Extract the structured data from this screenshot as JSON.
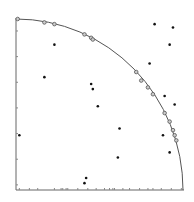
{
  "chart_data": {
    "type": "scatter",
    "title": "",
    "xlabel": "",
    "ylabel": "",
    "xlim": [
      0,
      1
    ],
    "ylim": [
      0,
      1
    ],
    "grid": false,
    "legend": null,
    "annotations": [],
    "reference_curve": {
      "type": "quarter-circle",
      "radius": 1,
      "center": [
        0,
        0
      ]
    },
    "series": [
      {
        "name": "on-arc points",
        "marker": "open-circle",
        "points": [
          [
            0.01,
            1.0
          ],
          [
            0.17,
            0.98
          ],
          [
            0.23,
            0.97
          ],
          [
            0.41,
            0.91
          ],
          [
            0.45,
            0.89
          ],
          [
            0.46,
            0.88
          ],
          [
            0.72,
            0.69
          ],
          [
            0.75,
            0.64
          ],
          [
            0.79,
            0.6
          ],
          [
            0.82,
            0.56
          ],
          [
            0.89,
            0.45
          ],
          [
            0.92,
            0.4
          ],
          [
            0.94,
            0.35
          ],
          [
            0.95,
            0.32
          ],
          [
            0.96,
            0.29
          ]
        ]
      },
      {
        "name": "interior points",
        "marker": "filled-dot",
        "points": [
          [
            0.23,
            0.85
          ],
          [
            0.17,
            0.66
          ],
          [
            0.45,
            0.62
          ],
          [
            0.46,
            0.59
          ],
          [
            0.49,
            0.49
          ],
          [
            0.62,
            0.36
          ],
          [
            0.61,
            0.19
          ],
          [
            0.83,
            0.97
          ],
          [
            0.94,
            0.95
          ],
          [
            0.92,
            0.85
          ],
          [
            0.8,
            0.74
          ],
          [
            0.89,
            0.55
          ],
          [
            0.95,
            0.5
          ],
          [
            0.88,
            0.32
          ],
          [
            0.92,
            0.22
          ],
          [
            0.42,
            0.07
          ],
          [
            0.41,
            0.04
          ],
          [
            0.02,
            0.32
          ]
        ]
      }
    ],
    "x_rug_ticks": [
      0.02,
      0.08,
      0.13,
      0.23,
      0.27,
      0.28,
      0.3,
      0.31,
      0.37,
      0.43,
      0.48,
      0.53,
      0.56,
      0.58,
      0.59,
      0.64,
      0.68,
      0.74,
      0.79,
      0.82,
      0.87,
      0.93,
      0.99
    ],
    "y_rug_ticks": [
      0.03,
      0.18,
      0.33,
      0.48,
      0.63,
      0.78,
      0.93
    ]
  },
  "style": {
    "marker_color": "#111111",
    "open_marker_stroke": "#555555",
    "axis_color": "#666666",
    "arc_color": "#555555"
  }
}
